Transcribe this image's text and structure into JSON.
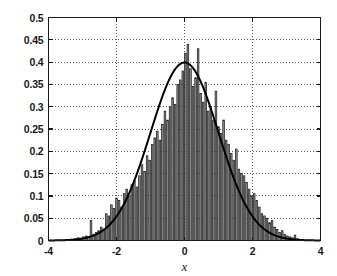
{
  "chart_data": {
    "type": "bar",
    "title": "",
    "subtitle": "",
    "xlabel": "x",
    "ylabel": "",
    "xlim": [
      -4,
      4
    ],
    "ylim": [
      0,
      0.5
    ],
    "grid": true,
    "grid_style": "dotted",
    "legend": null,
    "legend_position": "none",
    "xticks": [
      -4,
      -2,
      0,
      2,
      4
    ],
    "xtick_labels": [
      "-4",
      "-2",
      "0",
      "2",
      "4"
    ],
    "yticks": [
      0,
      0.05,
      0.1,
      0.15,
      0.2,
      0.25,
      0.3,
      0.35,
      0.4,
      0.45,
      0.5
    ],
    "ytick_labels": [
      "0",
      "0.05",
      "0.1",
      "0.15",
      "0.2",
      "0.25",
      "0.3",
      "0.35",
      "0.4",
      "0.45",
      "0.5"
    ],
    "bar_fill_color": "#8c8c8c",
    "bar_edge_color": "#1a1a1a",
    "curve_color": "#000000",
    "axis_color": "#1a1a1a",
    "bar_width": 0.075,
    "series": [
      {
        "name": "histogram",
        "type": "bar",
        "x": [
          -3.2,
          -3.125,
          -3.05,
          -2.975,
          -2.9,
          -2.825,
          -2.75,
          -2.675,
          -2.6,
          -2.525,
          -2.45,
          -2.375,
          -2.3,
          -2.225,
          -2.15,
          -2.075,
          -2.0,
          -1.925,
          -1.85,
          -1.775,
          -1.7,
          -1.625,
          -1.55,
          -1.475,
          -1.4,
          -1.325,
          -1.25,
          -1.175,
          -1.1,
          -1.025,
          -0.95,
          -0.875,
          -0.8,
          -0.725,
          -0.65,
          -0.575,
          -0.5,
          -0.425,
          -0.35,
          -0.275,
          -0.2,
          -0.125,
          -0.05,
          0.025,
          0.1,
          0.175,
          0.25,
          0.325,
          0.4,
          0.475,
          0.55,
          0.625,
          0.7,
          0.775,
          0.85,
          0.925,
          1.0,
          1.075,
          1.15,
          1.225,
          1.3,
          1.375,
          1.45,
          1.525,
          1.6,
          1.675,
          1.75,
          1.825,
          1.9,
          1.975,
          2.05,
          2.125,
          2.2,
          2.275,
          2.35,
          2.425,
          2.5,
          2.575,
          2.65,
          2.725,
          2.8,
          2.875,
          2.95,
          3.025,
          3.1,
          3.175,
          3.25,
          3.325
        ],
        "values": [
          0.004,
          0.006,
          0.005,
          0.008,
          0.01,
          0.009,
          0.045,
          0.014,
          0.018,
          0.022,
          0.03,
          0.026,
          0.06,
          0.055,
          0.08,
          0.072,
          0.095,
          0.09,
          0.075,
          0.105,
          0.115,
          0.1,
          0.125,
          0.135,
          0.12,
          0.145,
          0.17,
          0.155,
          0.19,
          0.18,
          0.215,
          0.23,
          0.245,
          0.225,
          0.26,
          0.29,
          0.27,
          0.3,
          0.32,
          0.305,
          0.35,
          0.36,
          0.38,
          0.42,
          0.44,
          0.385,
          0.345,
          0.365,
          0.43,
          0.33,
          0.31,
          0.355,
          0.29,
          0.3,
          0.27,
          0.335,
          0.255,
          0.24,
          0.27,
          0.225,
          0.215,
          0.195,
          0.18,
          0.205,
          0.16,
          0.15,
          0.145,
          0.13,
          0.115,
          0.1,
          0.105,
          0.09,
          0.075,
          0.06,
          0.055,
          0.05,
          0.04,
          0.045,
          0.03,
          0.025,
          0.018,
          0.022,
          0.014,
          0.01,
          0.008,
          0.006,
          0.012,
          0.004
        ]
      },
      {
        "name": "normal-pdf-curve",
        "type": "line",
        "mean": 0,
        "sigma": 1,
        "peak": 0.3989
      }
    ]
  },
  "axes": {
    "xlabel_text": "x"
  }
}
